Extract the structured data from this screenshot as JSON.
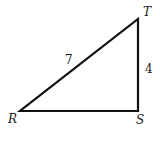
{
  "diagram": {
    "type": "right-triangle",
    "vertices": {
      "R": {
        "label": "R",
        "x": 20,
        "y": 111
      },
      "S": {
        "label": "S",
        "x": 138,
        "y": 111
      },
      "T": {
        "label": "T",
        "x": 138,
        "y": 19
      }
    },
    "sides": {
      "RT": {
        "label": "7"
      },
      "ST": {
        "label": "4"
      },
      "RS": {
        "label": ""
      }
    },
    "right_angle_at": "S",
    "stroke_color": "#111111"
  }
}
